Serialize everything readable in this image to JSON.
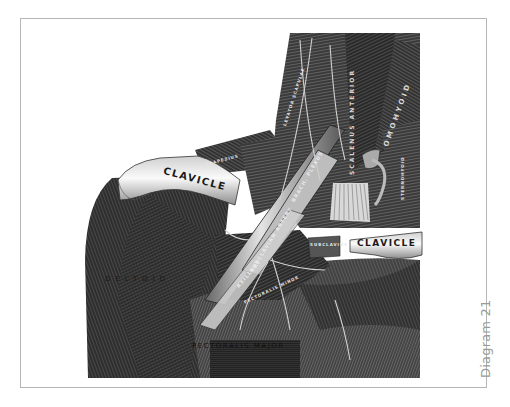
{
  "figure": {
    "caption": "Diagram 21",
    "style": "black-and-white anatomical engraving",
    "colors": {
      "frame_border": "#b5b5b5",
      "caption_text": "#9a9a9a",
      "background": "#ffffff"
    },
    "labels": {
      "clavicle_left": "CLAVICLE",
      "clavicle_right": "CLAVICLE",
      "deltoid": "DELTOID",
      "pectoralis_major": "PECTORALIS MAJOR",
      "brachial_plexus": "BRACH. PLEXUS",
      "subclavian_artery": "SUBCLAVIAN ARTERY",
      "axillary_artery": "AXILLARY",
      "scalenus_anterior": "SCALENUS ANTERIOR",
      "omohyoid": "OMOHYOID",
      "subclavius": "SUBCLAVIUS",
      "trapezius": "TRAPEZIUS",
      "pectoralis_minor": "PECTORALIS MINOR",
      "sternohyoid": "STERNOHYOID",
      "levator_scapulae": "LEVATOR SCAPULAE"
    }
  }
}
